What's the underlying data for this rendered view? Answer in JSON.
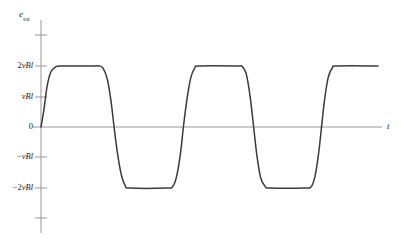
{
  "figure": {
    "background_color": "#ffffff",
    "curve_color": "#3a3a3a",
    "axis_color": "#8a8a8f",
    "text_color": "#1a1a1a",
    "y_axis_label_base": "e",
    "y_axis_label_subscript": "tot",
    "x_axis_label": "t"
  },
  "y_ticks": [
    {
      "value": 3,
      "label": "",
      "prefix": "",
      "py": 35
    },
    {
      "value": 2,
      "label": "2vBl",
      "prefix": "2",
      "body": "vBl",
      "py": 66
    },
    {
      "value": 1,
      "label": "vBl",
      "prefix": "",
      "body": "vBl",
      "py": 97
    },
    {
      "value": 0,
      "label": "0",
      "prefix": "",
      "body": "0",
      "py": 127
    },
    {
      "value": -1,
      "label": "−vBl",
      "prefix": "−",
      "body": "vBl",
      "py": 157
    },
    {
      "value": -2,
      "label": "−2vBl",
      "prefix": "−2",
      "body": "vBl",
      "py": 188
    },
    {
      "value": -3,
      "label": "",
      "prefix": "",
      "py": 218
    }
  ],
  "chart_data": {
    "type": "line",
    "title": "",
    "subtitle": "",
    "xlabel": "t",
    "ylabel": "e_tot",
    "grid": false,
    "legend": null,
    "ylim": [
      -3,
      3.2
    ],
    "xlim": [
      0,
      12
    ],
    "ytick_values": [
      2,
      1,
      0,
      -1,
      -2
    ],
    "ytick_labels": [
      "2vBl",
      "vBl",
      "0",
      "−vBl",
      "−2vBl"
    ],
    "xtick_values": [],
    "xtick_labels": [],
    "waveform_description": "Smoothed (trapezoidal) square wave of total emf e_tot alternating between +2vBl and -2vBl with rounded transitions",
    "series": [
      {
        "name": "e_tot",
        "color": "#3a3a3a",
        "amplitude_high": 2,
        "amplitude_low": -2,
        "units": "vBl",
        "points": [
          {
            "x": 0.0,
            "y": 0.0
          },
          {
            "x": 0.12,
            "y": 0.55
          },
          {
            "x": 0.25,
            "y": 1.3
          },
          {
            "x": 0.4,
            "y": 1.78
          },
          {
            "x": 0.6,
            "y": 1.96
          },
          {
            "x": 0.85,
            "y": 2.0
          },
          {
            "x": 2.0,
            "y": 2.0
          },
          {
            "x": 2.45,
            "y": 2.0
          },
          {
            "x": 2.62,
            "y": 1.92
          },
          {
            "x": 2.8,
            "y": 1.55
          },
          {
            "x": 2.95,
            "y": 0.85
          },
          {
            "x": 3.08,
            "y": 0.0
          },
          {
            "x": 3.22,
            "y": -0.85
          },
          {
            "x": 3.38,
            "y": -1.55
          },
          {
            "x": 3.55,
            "y": -1.92
          },
          {
            "x": 3.75,
            "y": -2.0
          },
          {
            "x": 5.3,
            "y": -2.0
          },
          {
            "x": 5.55,
            "y": -1.95
          },
          {
            "x": 5.72,
            "y": -1.6
          },
          {
            "x": 5.88,
            "y": -0.85
          },
          {
            "x": 6.0,
            "y": 0.0
          },
          {
            "x": 6.14,
            "y": 0.85
          },
          {
            "x": 6.3,
            "y": 1.58
          },
          {
            "x": 6.48,
            "y": 1.93
          },
          {
            "x": 6.68,
            "y": 2.0
          },
          {
            "x": 8.2,
            "y": 2.0
          },
          {
            "x": 8.48,
            "y": 1.98
          },
          {
            "x": 8.66,
            "y": 1.7
          },
          {
            "x": 8.82,
            "y": 0.95
          },
          {
            "x": 8.96,
            "y": 0.0
          },
          {
            "x": 9.1,
            "y": -0.95
          },
          {
            "x": 9.26,
            "y": -1.68
          },
          {
            "x": 9.45,
            "y": -1.95
          },
          {
            "x": 9.65,
            "y": -2.0
          },
          {
            "x": 11.1,
            "y": -2.0
          },
          {
            "x": 11.38,
            "y": -1.96
          },
          {
            "x": 11.55,
            "y": -1.6
          },
          {
            "x": 11.7,
            "y": -0.85
          },
          {
            "x": 11.82,
            "y": 0.0
          },
          {
            "x": 11.95,
            "y": 0.9
          },
          {
            "x": 12.1,
            "y": 1.62
          },
          {
            "x": 12.28,
            "y": 1.94
          },
          {
            "x": 12.48,
            "y": 2.0
          },
          {
            "x": 14.2,
            "y": 2.0
          }
        ]
      }
    ]
  }
}
